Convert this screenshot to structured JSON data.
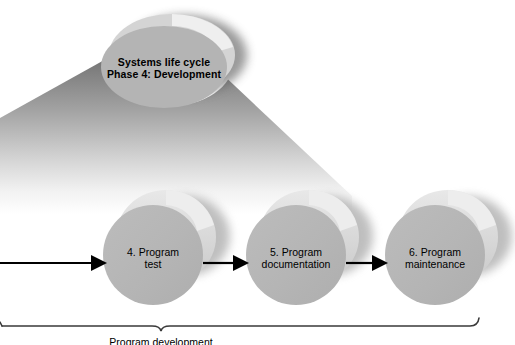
{
  "diagram": {
    "title_node": {
      "id": "phase-node",
      "line1": "Systems life cycle",
      "line2": "Phase 4: Development",
      "shape": "3d-disc",
      "fill": "#b4b4b4",
      "rim": "#dcdcdc",
      "shadow": "#6e6e6e"
    },
    "steps": [
      {
        "id": "step-program-test",
        "number": "4.",
        "line1": "4. Program",
        "line2": "test",
        "shape": "3d-cylinder",
        "fill": "#b6b6b6",
        "rim": "#dedede"
      },
      {
        "id": "step-program-documentation",
        "number": "5.",
        "line1": "5. Program",
        "line2": "documentation",
        "shape": "3d-cylinder",
        "fill": "#b6b6b6",
        "rim": "#dedede"
      },
      {
        "id": "step-program-maintenance",
        "number": "6.",
        "line1": "6. Program",
        "line2": "maintenance",
        "shape": "3d-cylinder",
        "fill": "#b6b6b6",
        "rim": "#dedede"
      }
    ],
    "arrows": [
      {
        "id": "arrow-into-step-4",
        "from": "",
        "to": "4. Program test"
      },
      {
        "id": "arrow-step-4-to-5",
        "from": "4. Program test",
        "to": "5. Program documentation"
      },
      {
        "id": "arrow-step-5-to-6",
        "from": "5. Program documentation",
        "to": "6. Program maintenance"
      }
    ],
    "brace": {
      "id": "grouping-brace",
      "caption": "Program development",
      "caption_clipped": true
    },
    "funnel": {
      "id": "perspective-funnel",
      "gradient_top": "#6f6f6f",
      "gradient_bottom": "#ffffff"
    },
    "colors": {
      "background": "#ffffff",
      "ink": "#000000",
      "shape_fill": "#b6b6b6",
      "shape_rim": "#dedede",
      "shadow": "#707070",
      "brace_stroke": "#3a3a3a"
    }
  }
}
